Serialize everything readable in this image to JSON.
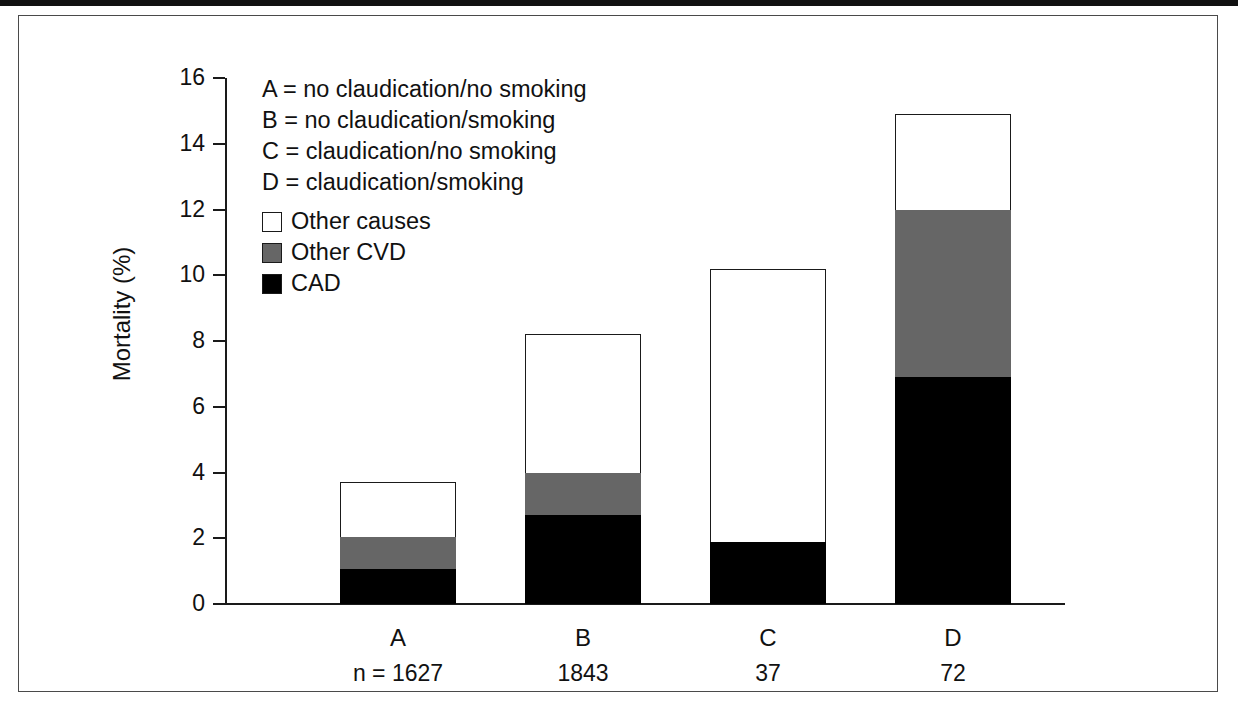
{
  "figure": {
    "annotations": [
      "A = no claudication/no smoking",
      "B = no claudication/smoking",
      "C = claudication/no smoking",
      "D = claudication/smoking"
    ]
  },
  "chart_data": {
    "type": "bar",
    "stacked": true,
    "title": "",
    "xlabel": "",
    "ylabel": "Mortality (%)",
    "ylim": [
      0,
      16
    ],
    "yticks": [
      0,
      2,
      4,
      6,
      8,
      10,
      12,
      14,
      16
    ],
    "ytick_labels": [
      "0",
      "2",
      "4",
      "6",
      "8",
      "10",
      "12",
      "14",
      "16"
    ],
    "grid": false,
    "legend_position": "upper-left-inside",
    "categories": [
      "A",
      "B",
      "C",
      "D"
    ],
    "category_notes": [
      "n = 1627",
      "1843",
      "37",
      "72"
    ],
    "series": [
      {
        "name": "CAD",
        "color": "#000000",
        "values": [
          1.05,
          2.7,
          1.9,
          6.9
        ]
      },
      {
        "name": "Other CVD",
        "color": "#666666",
        "values": [
          1.0,
          1.3,
          0.0,
          5.1
        ]
      },
      {
        "name": "Other causes",
        "color": "#ffffff",
        "values": [
          1.65,
          4.2,
          8.3,
          2.9
        ]
      }
    ],
    "totals": [
      3.7,
      8.2,
      10.2,
      14.9
    ],
    "cumulative": {
      "cad_top": [
        1.05,
        2.7,
        1.9,
        6.9
      ],
      "cvd_top": [
        2.05,
        4.0,
        1.9,
        12.0
      ],
      "total_top": [
        3.7,
        8.2,
        10.2,
        14.9
      ]
    },
    "legend_entries": [
      "Other causes",
      "Other CVD",
      "CAD"
    ],
    "annotations": [
      "A = no claudication/no smoking",
      "B = no claudication/smoking",
      "C = claudication/no smoking",
      "D = claudication/smoking"
    ]
  }
}
